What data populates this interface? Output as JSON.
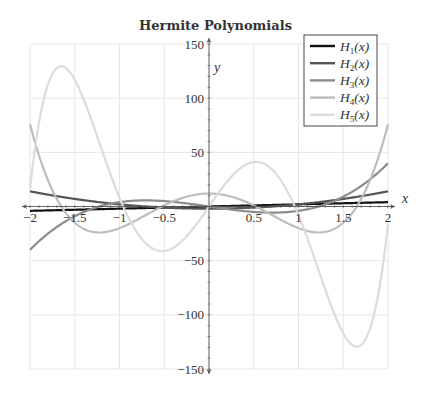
{
  "chart_data": {
    "type": "line",
    "title": "Hermite Polynomials",
    "xlabel": "x",
    "ylabel": "y",
    "xlim": [
      -2,
      2
    ],
    "ylim": [
      -150,
      150
    ],
    "grid": true,
    "legend_position": "upper right",
    "x_ticks": [
      -2,
      -1.5,
      -1,
      -0.5,
      0.5,
      1,
      1.5,
      2
    ],
    "x_tick_labels": [
      "−2",
      "−1.5",
      "−1",
      "−0.5",
      "0.5",
      "1",
      "1.5",
      "2"
    ],
    "y_ticks": [
      -150,
      -100,
      -50,
      50,
      100,
      150
    ],
    "y_tick_labels": [
      "−150",
      "−100",
      "−50",
      "50",
      "100",
      "150"
    ],
    "series": [
      {
        "name": "H_1(x)",
        "label_main": "H",
        "label_sub": "1",
        "label_arg": "(x)",
        "color": "#111111",
        "width": 2.2,
        "coeffs": [
          0,
          2
        ]
      },
      {
        "name": "H_2(x)",
        "label_main": "H",
        "label_sub": "2",
        "label_arg": "(x)",
        "color": "#555555",
        "width": 2.2,
        "coeffs": [
          -2,
          0,
          4
        ]
      },
      {
        "name": "H_3(x)",
        "label_main": "H",
        "label_sub": "3",
        "label_arg": "(x)",
        "color": "#8c8c8c",
        "width": 2.2,
        "coeffs": [
          0,
          -12,
          0,
          8
        ]
      },
      {
        "name": "H_4(x)",
        "label_main": "H",
        "label_sub": "4",
        "label_arg": "(x)",
        "color": "#bdbdbd",
        "width": 2.2,
        "coeffs": [
          12,
          0,
          -48,
          0,
          16
        ]
      },
      {
        "name": "H_5(x)",
        "label_main": "H",
        "label_sub": "5",
        "label_arg": "(x)",
        "color": "#dcdcdc",
        "width": 2.2,
        "coeffs": [
          0,
          120,
          0,
          -160,
          0,
          32
        ]
      }
    ],
    "sample_points": {
      "x": [
        -2,
        -1.5,
        -1,
        -0.5,
        0,
        0.5,
        1,
        1.5,
        2
      ],
      "H1": [
        -4,
        -3,
        -2,
        -1,
        0,
        1,
        2,
        3,
        4
      ],
      "H2": [
        14,
        7,
        2,
        -1,
        -2,
        -1,
        2,
        7,
        14
      ],
      "H3": [
        -40,
        -9,
        4,
        5,
        0,
        -5,
        -4,
        9,
        40
      ],
      "H4": [
        76,
        -3,
        -20,
        1,
        12,
        1,
        -20,
        -3,
        76
      ],
      "H5": [
        16,
        123,
        -8,
        -41,
        0,
        41,
        8,
        -123,
        -16
      ]
    }
  },
  "colors": {
    "grid": "#e6e6e6",
    "axis": "#555555",
    "legend_border": "#333333"
  }
}
